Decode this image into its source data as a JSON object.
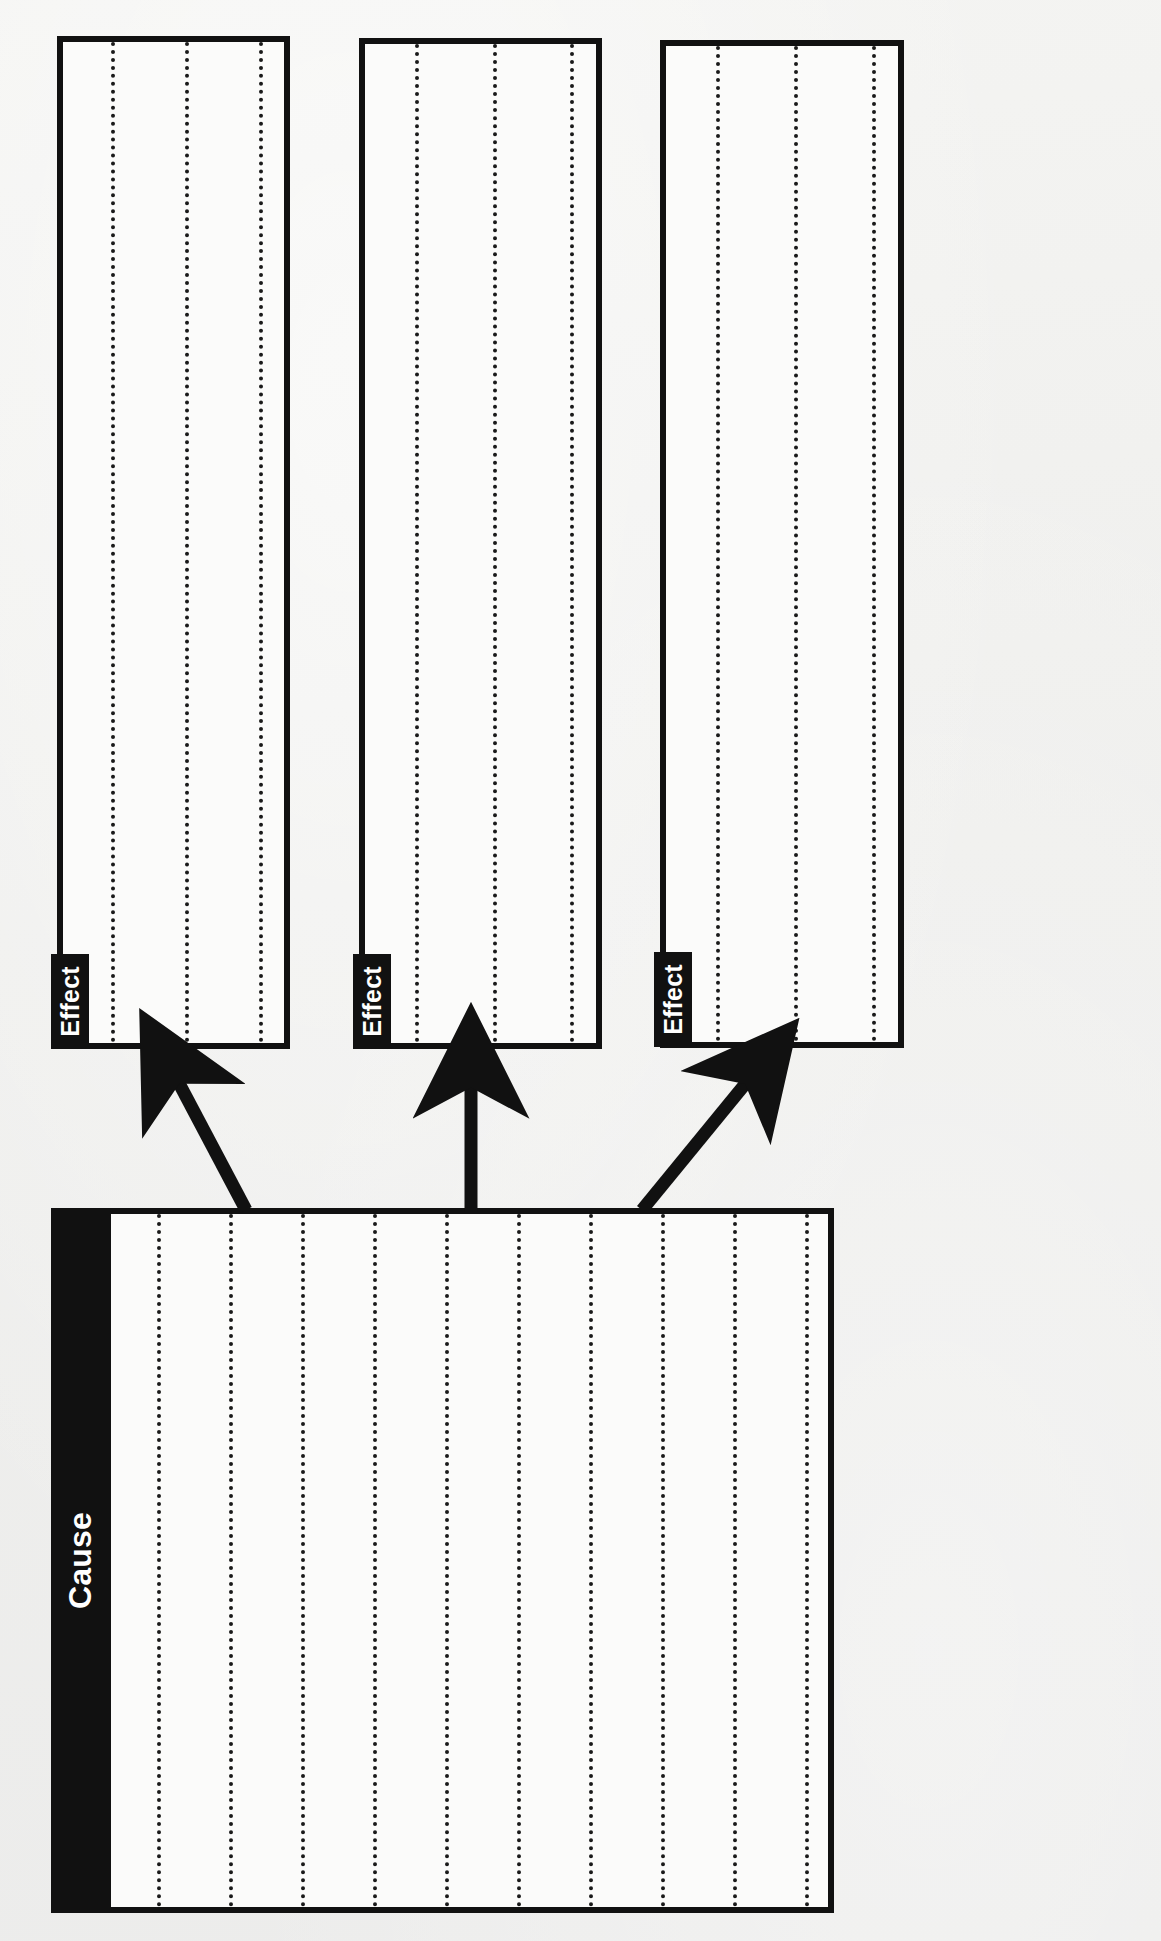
{
  "document": {
    "title": "Cause and Effect Graphic Organizer",
    "orientation": "landscape-rotated",
    "background_color": "#f2f2f0",
    "ink_color": "#111111"
  },
  "boxes": [
    {
      "id": "effect-1",
      "label": "Effect",
      "role": "effect",
      "rule_count": 3
    },
    {
      "id": "effect-2",
      "label": "Effect",
      "role": "effect",
      "rule_count": 3
    },
    {
      "id": "effect-3",
      "label": "Effect",
      "role": "effect",
      "rule_count": 3
    },
    {
      "id": "cause-1",
      "label": "Cause",
      "role": "cause",
      "rule_count": 10
    }
  ],
  "connectors": [
    {
      "id": "arrow-cause-to-effect-1",
      "from": "cause-1",
      "to": "effect-1",
      "shape": "diagonal-up-left"
    },
    {
      "id": "arrow-cause-to-effect-2",
      "from": "cause-1",
      "to": "effect-2",
      "shape": "straight-up"
    },
    {
      "id": "arrow-cause-to-effect-3",
      "from": "cause-1",
      "to": "effect-3",
      "shape": "diagonal-up-right"
    }
  ]
}
